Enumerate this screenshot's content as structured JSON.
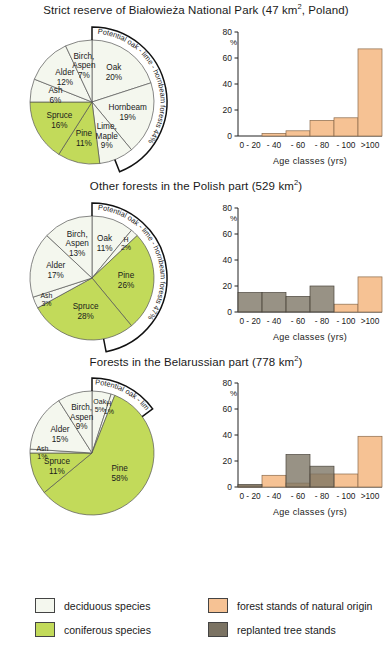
{
  "colors": {
    "deciduous": "#f4f7ee",
    "coniferous": "#c2da5a",
    "natural_origin": "#f6c294",
    "replanted": "#7b7363",
    "outline": "#555555",
    "text": "#1a1a1a"
  },
  "sections": [
    {
      "title_prefix": "Strict reserve of Białowieża National Park (47 km",
      "title_sup": "2",
      "title_suffix": ", Poland)",
      "arc_label": "Potential oak - lime - hornbeam forests",
      "arc_value": "44%",
      "pie": {
        "slices": [
          {
            "label": "Oak",
            "value": "20%",
            "pct": 20,
            "type": "deciduous"
          },
          {
            "label": "Hornbeam",
            "value": "19%",
            "pct": 19,
            "type": "deciduous"
          },
          {
            "label": "Lime, Maple",
            "value": "9%",
            "pct": 9,
            "type": "deciduous"
          },
          {
            "label": "Pine",
            "value": "11%",
            "pct": 11,
            "type": "coniferous"
          },
          {
            "label": "Spruce",
            "value": "16%",
            "pct": 16,
            "type": "coniferous"
          },
          {
            "label": "Ash",
            "value": "6%",
            "pct": 6,
            "type": "deciduous"
          },
          {
            "label": "Alder",
            "value": "12%",
            "pct": 12,
            "type": "deciduous"
          },
          {
            "label": "Birch, Aspen",
            "value": "7%",
            "pct": 7,
            "type": "deciduous"
          }
        ]
      },
      "chart_ref": 0
    },
    {
      "title_prefix": "Other forests in the Polish part (529 km",
      "title_sup": "2",
      "title_suffix": ")",
      "arc_label": "Potential oak - lime - hornbeam forests",
      "arc_value": "47%",
      "pie": {
        "slices": [
          {
            "label": "Oak",
            "value": "11%",
            "pct": 11,
            "type": "deciduous"
          },
          {
            "label": "H",
            "value": "2%",
            "pct": 2,
            "type": "deciduous"
          },
          {
            "label": "Pine",
            "value": "26%",
            "pct": 26,
            "type": "coniferous"
          },
          {
            "label": "Spruce",
            "value": "28%",
            "pct": 28,
            "type": "coniferous"
          },
          {
            "label": "Ash",
            "value": "3%",
            "pct": 3,
            "type": "deciduous"
          },
          {
            "label": "Alder",
            "value": "17%",
            "pct": 17,
            "type": "deciduous"
          },
          {
            "label": "Birch, Aspen",
            "value": "13%",
            "pct": 13,
            "type": "deciduous"
          }
        ]
      },
      "chart_ref": 1
    },
    {
      "title_prefix": "Forests in the Belarussian part (778 km",
      "title_sup": "2",
      "title_suffix": ")",
      "arc_label": "Potential oak - lime - hornbeam forests",
      "arc_value": "15%",
      "pie": {
        "slices": [
          {
            "label": "Oak",
            "value": "5%",
            "pct": 5,
            "type": "deciduous"
          },
          {
            "label": "H",
            "value": "1%",
            "pct": 1,
            "type": "deciduous"
          },
          {
            "label": "Pine",
            "value": "58%",
            "pct": 58,
            "type": "coniferous"
          },
          {
            "label": "Spruce",
            "value": "11%",
            "pct": 11,
            "type": "coniferous"
          },
          {
            "label": "Ash",
            "value": "1%",
            "pct": 1,
            "type": "deciduous"
          },
          {
            "label": "Alder",
            "value": "15%",
            "pct": 15,
            "type": "deciduous"
          },
          {
            "label": "Birch, Aspen",
            "value": "9%",
            "pct": 9,
            "type": "deciduous"
          }
        ]
      },
      "chart_ref": 2
    }
  ],
  "chart_data": [
    {
      "type": "bar",
      "title": "Strict reserve of Białowieża National Park",
      "categories": [
        "0 - 20",
        "- 40",
        "- 60",
        "- 80",
        "- 100",
        ">100"
      ],
      "series": [
        {
          "name": "forest stands of natural origin",
          "values": [
            0,
            2,
            4,
            12,
            14,
            67
          ]
        },
        {
          "name": "replanted tree stands",
          "values": [
            0,
            0,
            0,
            0,
            0,
            0
          ]
        }
      ],
      "xlabel": "Age  classes  (yrs)",
      "ylabel": "%",
      "ylim": [
        0,
        80
      ],
      "yticks": [
        0,
        20,
        40,
        60,
        80
      ],
      "grid": false
    },
    {
      "type": "bar",
      "title": "Other forests in the Polish part",
      "categories": [
        "0 - 20",
        "- 40",
        "- 60",
        "- 80",
        "- 100",
        ">100"
      ],
      "series": [
        {
          "name": "forest stands of natural origin",
          "values": [
            0,
            0,
            0,
            0,
            6,
            27
          ]
        },
        {
          "name": "replanted tree stands",
          "values": [
            15,
            15,
            12,
            20,
            0,
            0
          ]
        }
      ],
      "xlabel": "Age  classes  (yrs)",
      "ylabel": "%",
      "ylim": [
        0,
        80
      ],
      "yticks": [
        0,
        20,
        40,
        60,
        80
      ],
      "grid": false
    },
    {
      "type": "bar",
      "title": "Forests in the Belarussian part",
      "categories": [
        "0 - 20",
        "- 40",
        "- 60",
        "- 80",
        "- 100",
        ">100"
      ],
      "series": [
        {
          "name": "forest stands of natural origin",
          "values": [
            1,
            9,
            3,
            10,
            10,
            39
          ]
        },
        {
          "name": "replanted tree stands",
          "values": [
            2,
            0,
            25,
            16,
            0,
            0
          ]
        }
      ],
      "xlabel": "Age  classes  (yrs)",
      "ylabel": "%",
      "ylim": [
        0,
        80
      ],
      "yticks": [
        0,
        20,
        40,
        60,
        80
      ],
      "grid": false
    }
  ],
  "legend": {
    "items": [
      {
        "label": "deciduous species",
        "color_key": "deciduous"
      },
      {
        "label": "coniferous species",
        "color_key": "coniferous"
      },
      {
        "label": "forest stands of natural origin",
        "color_key": "natural_origin"
      },
      {
        "label": "replanted tree stands",
        "color_key": "replanted"
      }
    ]
  }
}
